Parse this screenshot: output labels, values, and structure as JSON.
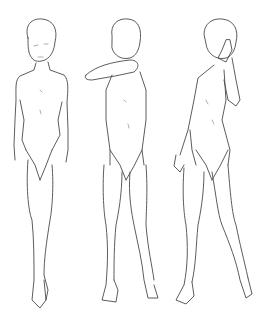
{
  "image": {
    "description": "Line-art sketch of three standing figure poses on white background",
    "background": "#ffffff",
    "line_color": "#4a4a4a",
    "figures": [
      {
        "id": "left",
        "pose": "standing, arms down, looking sideways"
      },
      {
        "id": "center",
        "pose": "standing, arm raised covering face"
      },
      {
        "id": "right",
        "pose": "standing, hand over face"
      }
    ]
  }
}
